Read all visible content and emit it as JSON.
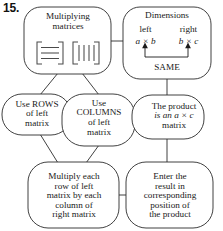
{
  "problem": {
    "number": "15."
  },
  "diagram": {
    "type": "flowchart",
    "topic": "Multiplying matrices",
    "nodes": [
      {
        "id": "multiplying-matrices",
        "lines": [
          "Multiplying",
          "matrices"
        ],
        "icons": [
          "matrix-rows-icon",
          "matrix-columns-icon"
        ]
      },
      {
        "id": "dimensions",
        "title": "Dimensions",
        "left_label": "left",
        "right_label": "right",
        "left_dims": "a × b",
        "right_dims": "b × c",
        "same_label": "SAME"
      },
      {
        "id": "use-rows",
        "lines": [
          "Use ROWS",
          "of left",
          "matrix"
        ]
      },
      {
        "id": "use-columns",
        "lines": [
          "Use",
          "COLUMNS",
          "of left",
          "matrix"
        ]
      },
      {
        "id": "product",
        "lines": [
          "The product",
          "is an a × c",
          "matrix"
        ]
      },
      {
        "id": "multiply-each",
        "lines": [
          "Multiply each",
          "row of left",
          "matrix by each",
          "column of",
          "right matrix"
        ]
      },
      {
        "id": "enter-result",
        "lines": [
          "Enter the",
          "result in",
          "corresponding",
          "position of",
          "the product"
        ]
      }
    ],
    "icon_detail": {
      "rows_icon_bars": 3,
      "columns_icon_bars": 4
    },
    "colors": {
      "background": "#ffffff",
      "outline": "#2b2b2b",
      "text": "#1a1a1a",
      "icon": "#4a4a4a"
    }
  }
}
